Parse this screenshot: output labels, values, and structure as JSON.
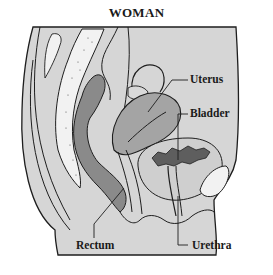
{
  "diagram": {
    "title": "WOMAN",
    "labels": [
      {
        "id": "uterus",
        "text": "Uterus"
      },
      {
        "id": "bladder",
        "text": "Bladder"
      },
      {
        "id": "rectum",
        "text": "Rectum"
      },
      {
        "id": "urethra",
        "text": "Urethra"
      }
    ],
    "colors": {
      "background": "#ffffff",
      "body_fill": "#d6d6d6",
      "organ_fill": "#9a9a9a",
      "dark_fill": "#6e6e6e",
      "outline": "#1e1e1e",
      "bone_fill": "#f2f2f2"
    }
  }
}
